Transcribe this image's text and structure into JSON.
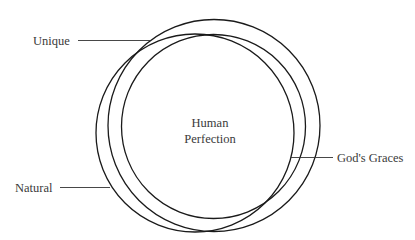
{
  "diagram": {
    "center_label": {
      "line1": "Human",
      "line2": "Perfection"
    },
    "labels": {
      "unique": "Unique",
      "natural": "Natural",
      "gods_graces": "God's Graces"
    },
    "colors": {
      "stroke": "#1a1a1a",
      "text": "#3a3a3a",
      "background": "#ffffff"
    }
  }
}
